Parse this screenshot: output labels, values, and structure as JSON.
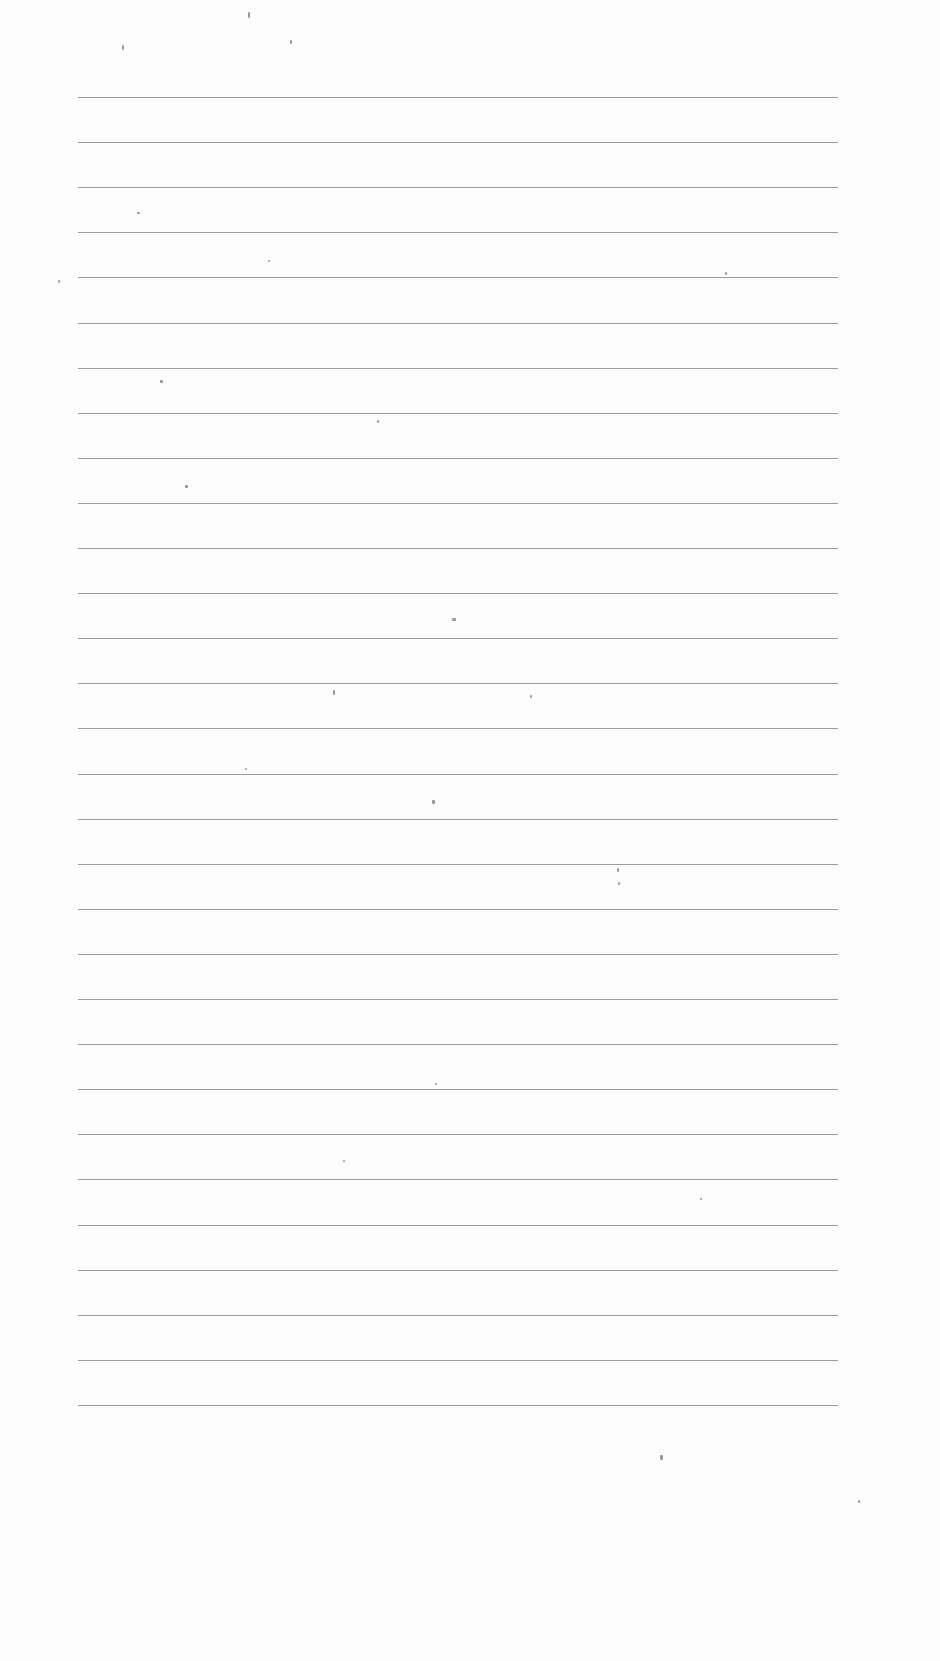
{
  "page": {
    "type": "blank lined paper",
    "line_count": 30,
    "first_line_y": 97,
    "line_spacing": 45.1,
    "line_left": 78,
    "line_width": 760,
    "line_color": "#8a8a8a",
    "background_color": "#fdfdfd"
  },
  "specks": [
    [
      248,
      12,
      2,
      6
    ],
    [
      122,
      45,
      2,
      5
    ],
    [
      290,
      40,
      2,
      4
    ],
    [
      137,
      212,
      3,
      2
    ],
    [
      268,
      260,
      2,
      2
    ],
    [
      725,
      272,
      2,
      3
    ],
    [
      160,
      380,
      3,
      3
    ],
    [
      377,
      420,
      2,
      3
    ],
    [
      185,
      485,
      3,
      3
    ],
    [
      452,
      618,
      4,
      3
    ],
    [
      333,
      690,
      2,
      5
    ],
    [
      530,
      695,
      2,
      3
    ],
    [
      245,
      768,
      2,
      2
    ],
    [
      432,
      800,
      3,
      4
    ],
    [
      617,
      868,
      2,
      4
    ],
    [
      618,
      882,
      2,
      3
    ],
    [
      343,
      1160,
      2,
      2
    ],
    [
      700,
      1198,
      2,
      2
    ],
    [
      660,
      1455,
      3,
      5
    ],
    [
      435,
      1083,
      2,
      2
    ],
    [
      58,
      280,
      2,
      3
    ],
    [
      858,
      1500,
      2,
      3
    ]
  ]
}
